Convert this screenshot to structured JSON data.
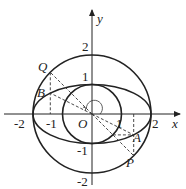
{
  "diagram": {
    "type": "coordinate-geometry",
    "axes": {
      "x_label": "x",
      "y_label": "y",
      "origin_label": "O",
      "x_ticks": [
        "-2",
        "-1",
        "1",
        "2"
      ],
      "y_ticks": [
        "2",
        "1",
        "-1",
        "-2"
      ]
    },
    "curves": [
      {
        "name": "big-circle",
        "radius": 2
      },
      {
        "name": "small-circle",
        "radius": 1
      },
      {
        "name": "ellipse",
        "a": 2,
        "b": 1
      }
    ],
    "points": {
      "Q": {
        "label": "Q",
        "x": -1.41,
        "y": 1.41
      },
      "B": {
        "label": "B",
        "x": -1.41,
        "y": 0.71
      },
      "A": {
        "label": "A",
        "x": 1.41,
        "y": -0.71
      },
      "P": {
        "label": "P",
        "x": 1.41,
        "y": -1.41
      }
    },
    "colors": {
      "stroke": "#222222",
      "background": "#ffffff"
    }
  }
}
